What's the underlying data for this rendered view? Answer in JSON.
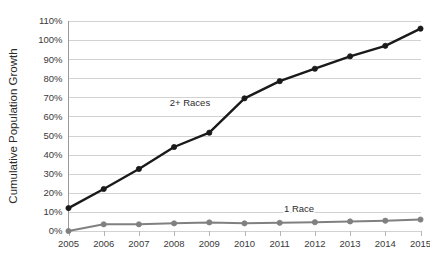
{
  "chart_data": {
    "type": "line",
    "title": "",
    "xlabel": "",
    "ylabel": "Cumulative Population Growth",
    "x": [
      2005,
      2006,
      2007,
      2008,
      2009,
      2010,
      2011,
      2012,
      2013,
      2014,
      2015
    ],
    "xtick_labels": [
      "2005",
      "2006",
      "2007",
      "2008",
      "2009",
      "2010",
      "2011",
      "2012",
      "2013",
      "2014",
      "2015"
    ],
    "ytick_labels": [
      "0%",
      "10%",
      "20%",
      "30%",
      "40%",
      "50%",
      "60%",
      "70%",
      "80%",
      "90%",
      "100%",
      "110%"
    ],
    "ytick_values": [
      0,
      10,
      20,
      30,
      40,
      50,
      60,
      70,
      80,
      90,
      100,
      110
    ],
    "ylim": [
      0,
      110
    ],
    "xlim": [
      2005,
      2015
    ],
    "grid": "horizontal",
    "legend": "inline-annotations",
    "series": [
      {
        "name": "2+ Races",
        "color": "#1a1a1a",
        "marker": "circle",
        "line_width": 2.4,
        "values": [
          12,
          22,
          32.5,
          44,
          51.5,
          69.5,
          78.5,
          85,
          91.5,
          97,
          106
        ],
        "annotation": {
          "text": "2+ Races",
          "x": 2008.45,
          "y": 65.5
        }
      },
      {
        "name": "1 Race",
        "color": "#808080",
        "marker": "circle",
        "line_width": 2.0,
        "values": [
          0,
          3.5,
          3.5,
          4.0,
          4.5,
          4.0,
          4.3,
          4.6,
          5.0,
          5.4,
          6.0
        ],
        "annotation": {
          "text": "1 Race",
          "x": 2011.55,
          "y": 10.0
        }
      }
    ]
  },
  "colors": {
    "background": "#ffffff",
    "gridline": "#d2d2d2",
    "axis_spine": "#9a9a9a",
    "tick_text": "#3a3a3a",
    "axis_title": "#2b2b2b",
    "series_2plus": "#1a1a1a",
    "series_1race": "#808080"
  }
}
